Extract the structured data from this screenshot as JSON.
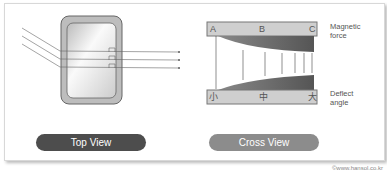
{
  "buttons": {
    "top_view": "Top View",
    "cross_view": "Cross View"
  },
  "cross": {
    "top_labels": [
      "A",
      "B",
      "C"
    ],
    "bottom_labels": [
      "小",
      "中",
      "大"
    ],
    "magnetic_force_line1": "Magnetic",
    "magnetic_force_line2": "force",
    "deflect_line1": "Deflect",
    "deflect_line2": "angle"
  },
  "watermark": "©www.hansol.co.kr"
}
